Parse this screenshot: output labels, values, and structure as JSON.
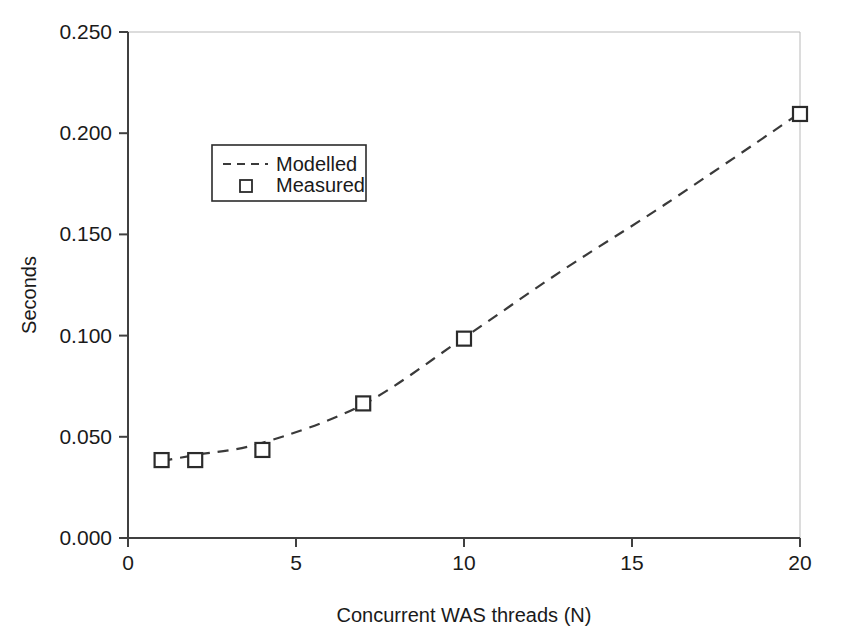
{
  "chart_data": {
    "type": "scatter",
    "title": "",
    "xlabel": "Concurrent WAS threads (N)",
    "ylabel": "Seconds",
    "xlim": [
      0,
      20
    ],
    "ylim": [
      0.0,
      0.25
    ],
    "xticks": [
      "0",
      "5",
      "10",
      "15",
      "20"
    ],
    "xtick_values": [
      0,
      5,
      10,
      15,
      20
    ],
    "yticks": [
      "0.000",
      "0.050",
      "0.100",
      "0.150",
      "0.200",
      "0.250"
    ],
    "ytick_values": [
      0.0,
      0.05,
      0.1,
      0.15,
      0.2,
      0.25
    ],
    "grid": false,
    "legend_position": "upper-left-inside",
    "series": [
      {
        "name": "Modelled",
        "style": "dashed-line",
        "x": [
          1,
          2,
          4,
          7,
          10,
          13,
          16,
          20
        ],
        "values": [
          0.038,
          0.041,
          0.047,
          0.066,
          0.099,
          0.133,
          0.165,
          0.21
        ]
      },
      {
        "name": "Measured",
        "style": "open-square-markers",
        "x": [
          1,
          2,
          4,
          7,
          10,
          20
        ],
        "values": [
          0.0385,
          0.0385,
          0.0435,
          0.0665,
          0.0985,
          0.2095
        ]
      }
    ]
  },
  "legend": {
    "entries": [
      {
        "label": "Modelled",
        "marker": "dashed-line"
      },
      {
        "label": "Measured",
        "marker": "open-square"
      }
    ]
  },
  "colors": {
    "axis": "#404040",
    "series_line": "#3a3a3a",
    "marker_stroke": "#2b2b2b",
    "marker_fill": "#ffffff",
    "background": "#ffffff"
  }
}
